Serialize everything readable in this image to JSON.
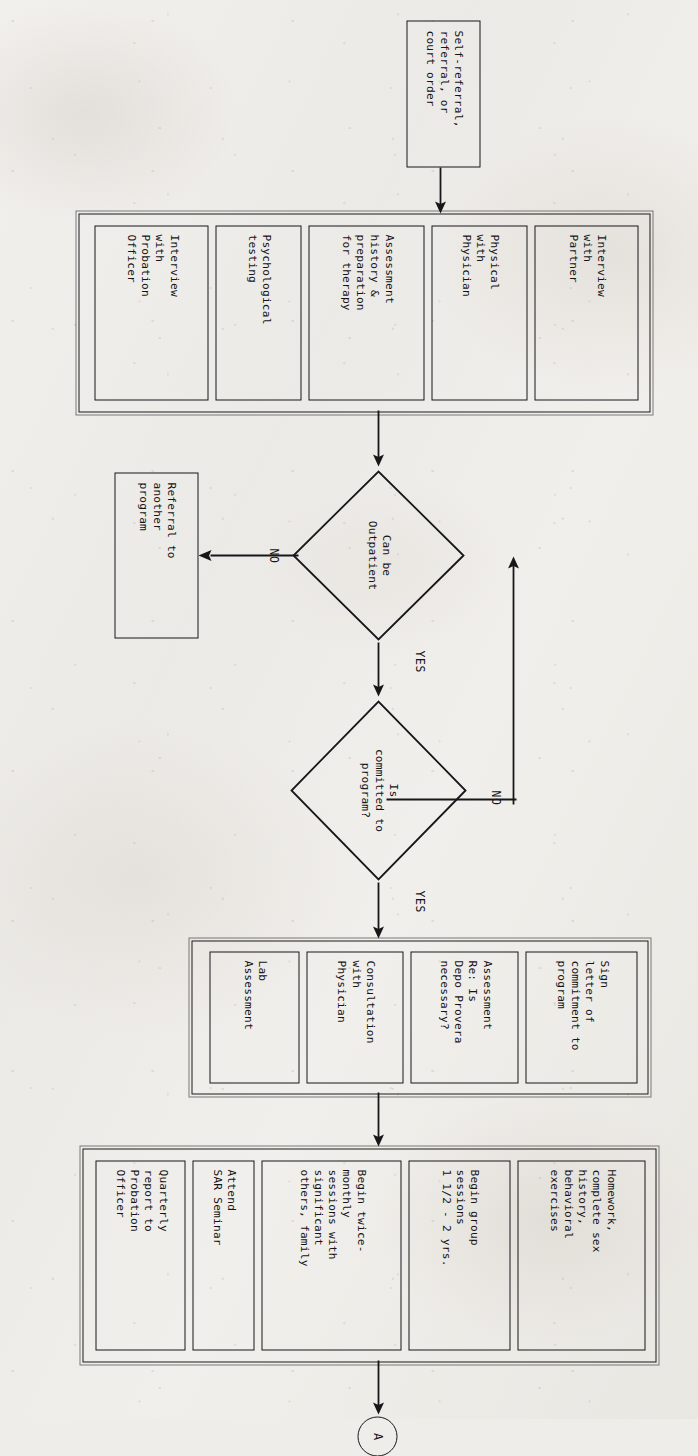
{
  "diagram": {
    "orientation": "rotated-90-clockwise",
    "ink_color": "#17171a",
    "paper_color": "#efedea"
  },
  "start": {
    "label": "Self-referral,\nreferral, or\ncourt order"
  },
  "intake_group": {
    "name": "intake-assessment-group",
    "items": [
      {
        "label": "Interview\nwith\nPartner"
      },
      {
        "label": "Physical\nwith\nPhysician"
      },
      {
        "label": "Assessment\nhistory &\npreparation\nfor therapy"
      },
      {
        "label": "Psychological\ntesting"
      },
      {
        "label": "Interview\nwith\nProbation\nOfficer"
      }
    ]
  },
  "decision_outpatient": {
    "label": "Can be\nOutpatient",
    "yes_label": "YES",
    "no_label": "NO"
  },
  "decision_committed": {
    "label": "Is\ncommitted to\nprogram?",
    "yes_label": "YES",
    "no_label": "NO"
  },
  "referral_box": {
    "label": "Referral to\nanother\nprogram"
  },
  "commitment_group": {
    "name": "commitment-intake-group",
    "items": [
      {
        "label": "Sign\nletter of\ncommitment to\nprogram"
      },
      {
        "label": "Assessment\nRe: Is\nDepo Provera\nnecessary?"
      },
      {
        "label": "Consultation\nwith\nPhysician"
      },
      {
        "label": "Lab\nAssessment"
      }
    ]
  },
  "treatment_group": {
    "name": "treatment-activities-group",
    "items": [
      {
        "label": "Homework,\ncomplete sex\nhistory,\nbehavioral\nexercises"
      },
      {
        "label": "Begin group\nsessions\n1 1/2 - 2 yrs."
      },
      {
        "label": "Begin twice-\nmonthly\nsessions with\nsignificant\nothers, family"
      },
      {
        "label": "Attend\nSAR Seminar"
      },
      {
        "label": "Quarterly\nreport to\nProbation\nOfficer"
      }
    ]
  },
  "offpage_connector": {
    "label": "A"
  }
}
